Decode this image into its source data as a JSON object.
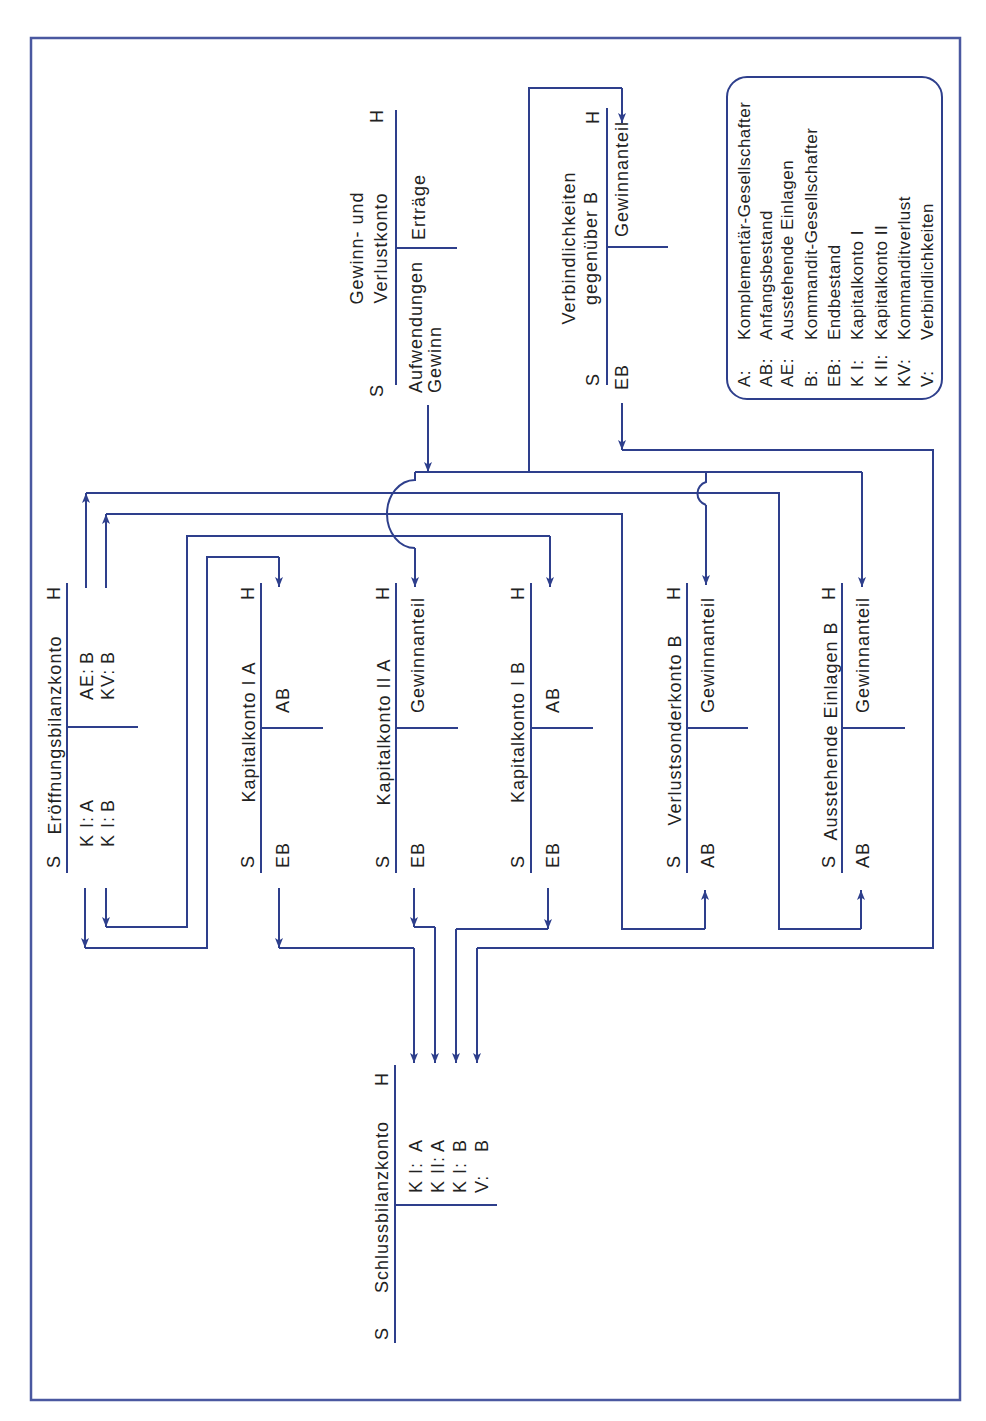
{
  "diagram": {
    "accounts": {
      "ebk": {
        "title": "Eröffnungsbilanzkonto",
        "debit_label": "S",
        "credit_label": "H",
        "debit_entries": [
          {
            "label": "K I:",
            "value": "A"
          },
          {
            "label": "K I:",
            "value": "B"
          }
        ],
        "credit_entries": [
          {
            "label": "AE:",
            "value": "B"
          },
          {
            "label": "KV:",
            "value": "B"
          }
        ]
      },
      "k1a": {
        "title": "Kapitalkonto I A",
        "debit_label": "S",
        "credit_label": "H",
        "debit_entries": [
          "EB"
        ],
        "credit_entries": [
          "AB"
        ]
      },
      "k2a": {
        "title": "Kapitalkonto II A",
        "debit_label": "S",
        "credit_label": "H",
        "debit_entries": [
          "EB"
        ],
        "credit_entries": [
          "Gewinnanteil"
        ]
      },
      "k1b": {
        "title": "Kapitalkonto I B",
        "debit_label": "S",
        "credit_label": "H",
        "debit_entries": [
          "EB"
        ],
        "credit_entries": [
          "AB"
        ]
      },
      "vsk_b": {
        "title": "Verlustsonderkonto B",
        "debit_label": "S",
        "credit_label": "H",
        "debit_entries": [
          "AB"
        ],
        "credit_entries": [
          "Gewinnanteil"
        ]
      },
      "ae_b": {
        "title": "Ausstehende Einlagen B",
        "debit_label": "S",
        "credit_label": "H",
        "debit_entries": [
          "AB"
        ],
        "credit_entries": [
          "Gewinnanteil"
        ]
      },
      "verb_b": {
        "title_lines": [
          "Verbindlichkeiten",
          "gegenüber B"
        ],
        "debit_label": "S",
        "credit_label": "H",
        "debit_entries": [
          "EB"
        ],
        "credit_entries": [
          "Gewinnanteil"
        ]
      },
      "guv": {
        "title_lines": [
          "Gewinn- und",
          "Verlustkonto"
        ],
        "debit_label": "S",
        "credit_label": "H",
        "debit_entries": [
          "Aufwendungen",
          "Gewinn"
        ],
        "credit_entries": [
          "Erträge"
        ]
      },
      "sbk": {
        "title": "Schlussbilanzkonto",
        "debit_label": "S",
        "credit_label": "H",
        "debit_entries": [],
        "credit_entries": [
          {
            "label": "K I:",
            "value": "A"
          },
          {
            "label": "K II:",
            "value": "A"
          },
          {
            "label": "K I:",
            "value": "B"
          },
          {
            "label": "V:",
            "value": "B"
          }
        ]
      }
    },
    "legend": {
      "items": [
        {
          "abbr": "A:",
          "text": "Komplementär-Gesellschafter"
        },
        {
          "abbr": "AB:",
          "text": "Anfangsbestand"
        },
        {
          "abbr": "AE:",
          "text": "Ausstehende Einlagen"
        },
        {
          "abbr": "B:",
          "text": "Kommandit-Gesellschafter"
        },
        {
          "abbr": "EB:",
          "text": "Endbestand"
        },
        {
          "abbr": "K I:",
          "text": "Kapitalkonto I"
        },
        {
          "abbr": "K II:",
          "text": "Kapitalkonto II"
        },
        {
          "abbr": "KV:",
          "text": "Kommanditverlust"
        },
        {
          "abbr": "V:",
          "text": "Verbindlichkeiten"
        }
      ]
    },
    "colors": {
      "line": "#2e3f8c",
      "frame": "#4a58a0",
      "text": "#222222",
      "background": "#ffffff"
    }
  }
}
